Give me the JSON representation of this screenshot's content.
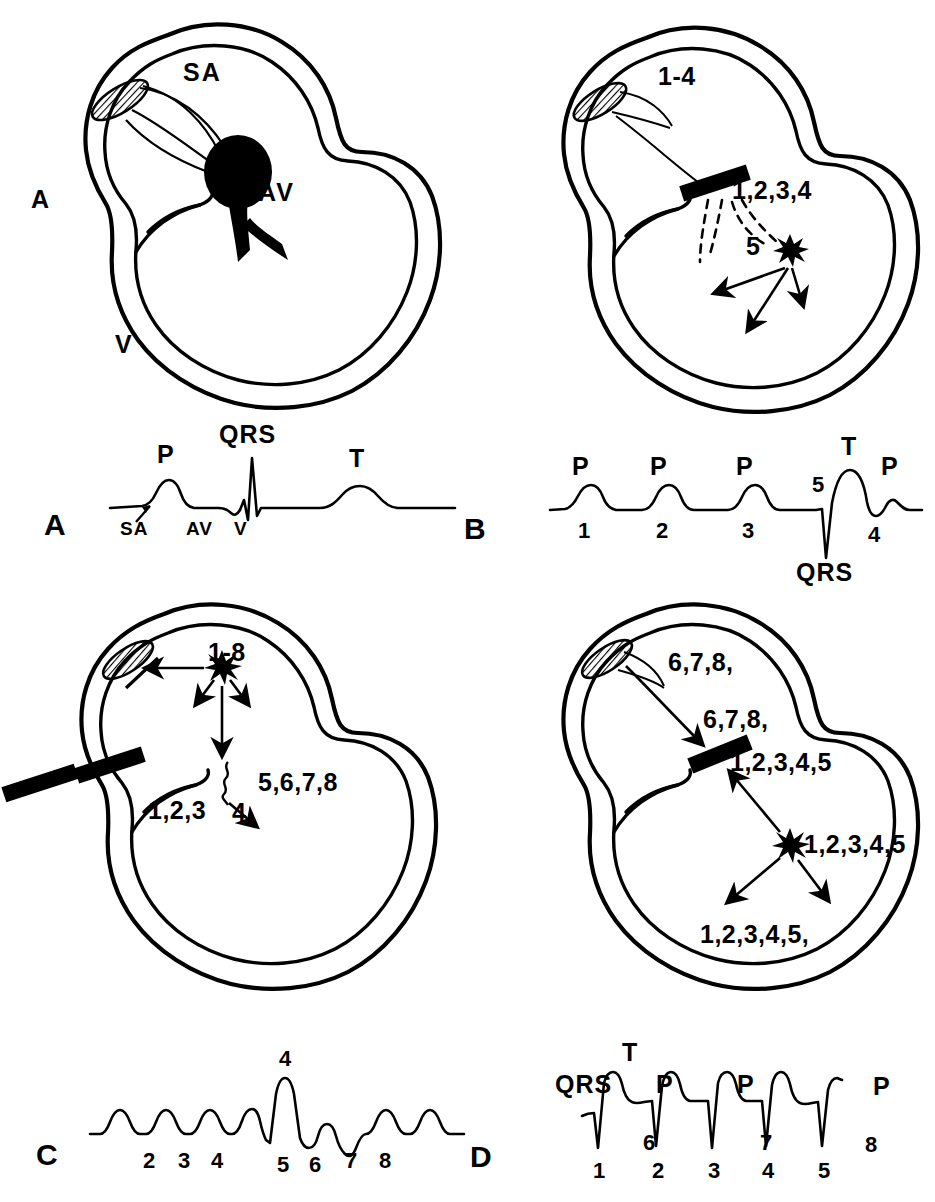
{
  "figure": {
    "background_color": "#ffffff",
    "ink_color": "#000000"
  },
  "panels": [
    {
      "id": "A",
      "letter": "A",
      "heart": {
        "labels": [
          {
            "name": "sa-node-label",
            "text": "SA"
          },
          {
            "name": "av-node-label",
            "text": "AV"
          },
          {
            "name": "atrium-label",
            "text": "A"
          },
          {
            "name": "ventricle-label",
            "text": "V"
          }
        ],
        "features": [
          "hatched-sa-node",
          "filled-av-node",
          "conduction-pathways"
        ]
      },
      "ecg": {
        "letter": "A",
        "above_labels": [
          {
            "name": "p-wave-label",
            "text": "P"
          },
          {
            "name": "qrs-label",
            "text": "QRS"
          },
          {
            "name": "t-wave-label",
            "text": "T"
          }
        ],
        "below_labels": [
          {
            "name": "sa-tick-label",
            "text": "SA"
          },
          {
            "name": "av-tick-label",
            "text": "AV"
          },
          {
            "name": "v-tick-label",
            "text": "V"
          }
        ]
      }
    },
    {
      "id": "B",
      "letter": "B",
      "heart": {
        "labels": [
          {
            "name": "sa-beats-label",
            "text": "1-4"
          },
          {
            "name": "blocked-beats-label",
            "text": "1,2,3,4"
          },
          {
            "name": "escape-beat-label",
            "text": "5"
          }
        ],
        "features": [
          "hatched-sa-node",
          "av-block-bar",
          "dashed-blocked-paths",
          "ectopic-focus-starburst",
          "ventricular-arrows"
        ]
      },
      "ecg": {
        "letter": "B",
        "above_labels": [
          {
            "name": "p-wave-label",
            "text": "P"
          },
          {
            "name": "p-wave-label",
            "text": "P"
          },
          {
            "name": "p-wave-label",
            "text": "P"
          },
          {
            "name": "escape-marker-label",
            "text": "5"
          },
          {
            "name": "t-wave-label",
            "text": "T"
          },
          {
            "name": "p-wave-label",
            "text": "P"
          }
        ],
        "below_labels": [
          {
            "name": "beat-number",
            "text": "1"
          },
          {
            "name": "beat-number",
            "text": "2"
          },
          {
            "name": "beat-number",
            "text": "3"
          },
          {
            "name": "beat-number",
            "text": "4"
          },
          {
            "name": "qrs-label",
            "text": "QRS"
          }
        ]
      }
    },
    {
      "id": "C",
      "letter": "C",
      "heart": {
        "labels": [
          {
            "name": "ectopic-beats-label",
            "text": "1-8"
          },
          {
            "name": "conducted-beats-left-label",
            "text": "1,2,3"
          },
          {
            "name": "aberrant-beat-label",
            "text": "4"
          },
          {
            "name": "conducted-beats-right-label",
            "text": "5,6,7,8"
          }
        ],
        "features": [
          "hatched-sa-node",
          "sa-suppression-slash",
          "atrial-ectopic-starburst",
          "dual-block-bars",
          "wavy-aberrant-path"
        ]
      },
      "ecg": {
        "letter": "C",
        "above_labels": [
          {
            "name": "aberrant-peak-label",
            "text": "4"
          }
        ],
        "below_labels": [
          {
            "name": "beat-number",
            "text": "2"
          },
          {
            "name": "beat-number",
            "text": "3"
          },
          {
            "name": "beat-number",
            "text": "4"
          },
          {
            "name": "beat-number",
            "text": "5"
          },
          {
            "name": "beat-number",
            "text": "6"
          },
          {
            "name": "beat-number",
            "text": "7"
          },
          {
            "name": "beat-number",
            "text": "8"
          }
        ]
      }
    },
    {
      "id": "D",
      "letter": "D",
      "heart": {
        "labels": [
          {
            "name": "retrograde-sa-label",
            "text": "6,7,8,"
          },
          {
            "name": "retrograde-path-label",
            "text": "6,7,8,"
          },
          {
            "name": "blocked-retrograde-label",
            "text": "1,2,3,4,5"
          },
          {
            "name": "ventricular-focus-label",
            "text": "1,2,3,4,5"
          },
          {
            "name": "ventricular-spread-label",
            "text": "1,2,3,4,5,"
          }
        ],
        "features": [
          "hatched-sa-node",
          "av-block-bar",
          "ventricular-ectopic-starburst",
          "retrograde-arrow",
          "ventricular-arrows"
        ]
      },
      "ecg": {
        "letter": "D",
        "above_labels": [
          {
            "name": "qrs-label",
            "text": "QRS"
          },
          {
            "name": "t-wave-label",
            "text": "T"
          },
          {
            "name": "p-wave-label",
            "text": "P"
          },
          {
            "name": "p-wave-label",
            "text": "P"
          },
          {
            "name": "p-wave-label",
            "text": "P"
          }
        ],
        "inline_labels": [
          {
            "name": "retrograde-p-number",
            "text": "6"
          },
          {
            "name": "retrograde-p-number",
            "text": "7"
          },
          {
            "name": "retrograde-p-number",
            "text": "8"
          }
        ],
        "below_labels": [
          {
            "name": "beat-number",
            "text": "1"
          },
          {
            "name": "beat-number",
            "text": "2"
          },
          {
            "name": "beat-number",
            "text": "3"
          },
          {
            "name": "beat-number",
            "text": "4"
          },
          {
            "name": "beat-number",
            "text": "5"
          }
        ]
      }
    }
  ]
}
